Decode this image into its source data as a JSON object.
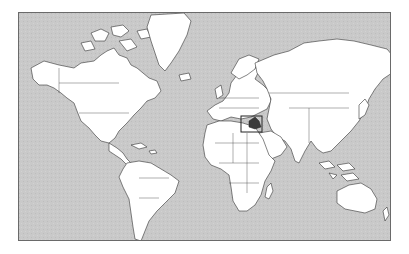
{
  "map": {
    "type": "world-political-outline",
    "projection": "mercator",
    "colors": {
      "ocean": "#c8c8c8",
      "land": "#ffffff",
      "border": "#333333",
      "highlight": "#3a3a3a",
      "frame": "#6a6a6a"
    },
    "highlighted_region": {
      "name": "Iraq",
      "locator_box": true
    }
  }
}
